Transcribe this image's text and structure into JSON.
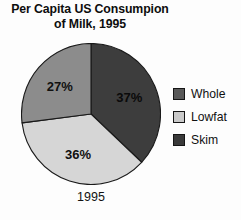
{
  "title": {
    "line1": "Per Capita US Consumpion",
    "line2": "of Milk, 1995"
  },
  "category_label": "1995",
  "legend": {
    "items": [
      {
        "label": "Whole",
        "swatch_color": "#595959"
      },
      {
        "label": "Lowfat",
        "swatch_color": "#c9c9c9"
      },
      {
        "label": "Skim",
        "swatch_color": "#3a3a3a"
      }
    ]
  },
  "chart_data": {
    "type": "pie",
    "title": "Per Capita US Consumpion of Milk, 1995",
    "category": "1995",
    "start_angle_deg": 0,
    "direction": "clockwise",
    "legend_position": "right",
    "labels": [
      "Whole",
      "Lowfat",
      "Skim"
    ],
    "values": [
      37,
      36,
      27
    ],
    "value_labels": [
      "37%",
      "36%",
      "27%"
    ],
    "units": "percent",
    "colors": [
      "#3d3d3d",
      "#d6d6d6",
      "#8c8c8c"
    ],
    "slices": [
      {
        "name": "Whole",
        "value": 37,
        "label": "37%",
        "color": "#3d3d3d",
        "label_tone": "on-dark"
      },
      {
        "name": "Lowfat",
        "value": 36,
        "label": "36%",
        "color": "#d6d6d6",
        "label_tone": "on-light"
      },
      {
        "name": "Skim",
        "value": 27,
        "label": "27%",
        "color": "#8c8c8c",
        "label_tone": "on-light"
      }
    ]
  }
}
